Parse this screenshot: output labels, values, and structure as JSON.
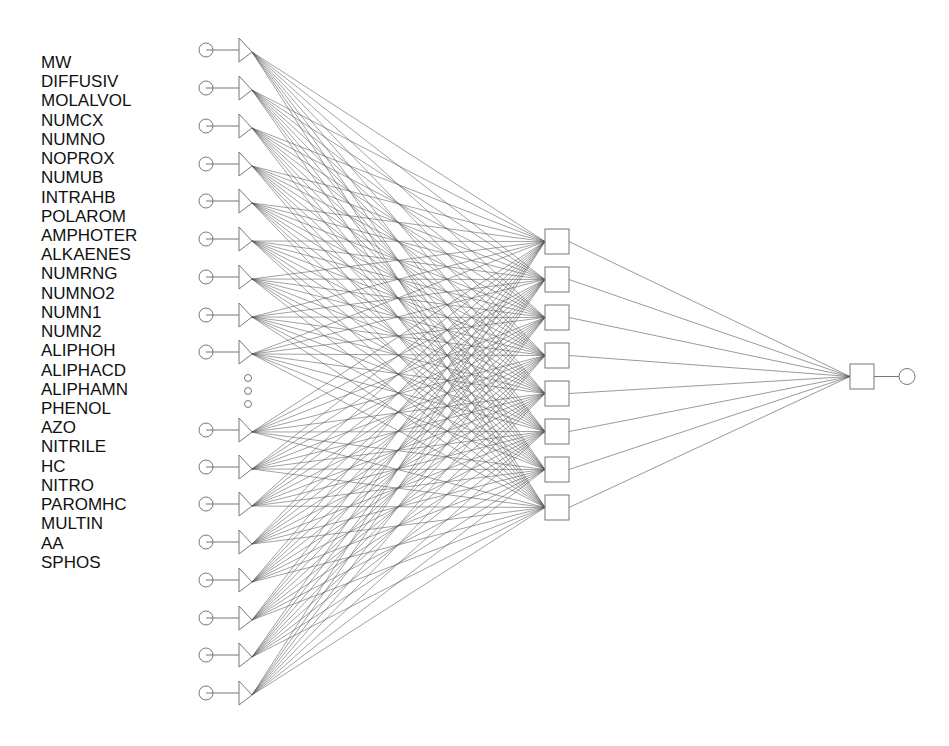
{
  "diagram": {
    "type": "neural-network",
    "input_labels": [
      "MW",
      "DIFFUSIV",
      "MOLALVOL",
      "NUMCX",
      "NUMNO",
      "NOPROX",
      "NUMUB",
      "INTRAHB",
      "POLAROM",
      "AMPHOTER",
      "ALKAENES",
      "NUMRNG",
      "NUMNO2",
      "NUMN1",
      "NUMN2",
      "ALIPHOH",
      "ALIPHACD",
      "ALIPHAMN",
      "PHENOL",
      "AZO",
      "NITRILE",
      "HC",
      "NITRO",
      "PAROMHC",
      "MULTIN",
      "AA",
      "SPHOS"
    ],
    "input_nodes_top_y": [
      50,
      88,
      126,
      164,
      201,
      239,
      277,
      315,
      352
    ],
    "input_nodes_bottom_y": [
      430,
      467,
      504,
      542,
      580,
      618,
      655,
      693
    ],
    "ellipsis_dots_y": [
      378,
      391,
      404
    ],
    "hidden_layer_count": 8,
    "hidden_box_top_y": [
      229,
      267,
      305,
      343,
      381,
      419,
      457,
      495
    ],
    "output_nodes": 1,
    "colors": {
      "line": "#555555",
      "node_stroke": "#777777",
      "text": "#111111"
    }
  }
}
